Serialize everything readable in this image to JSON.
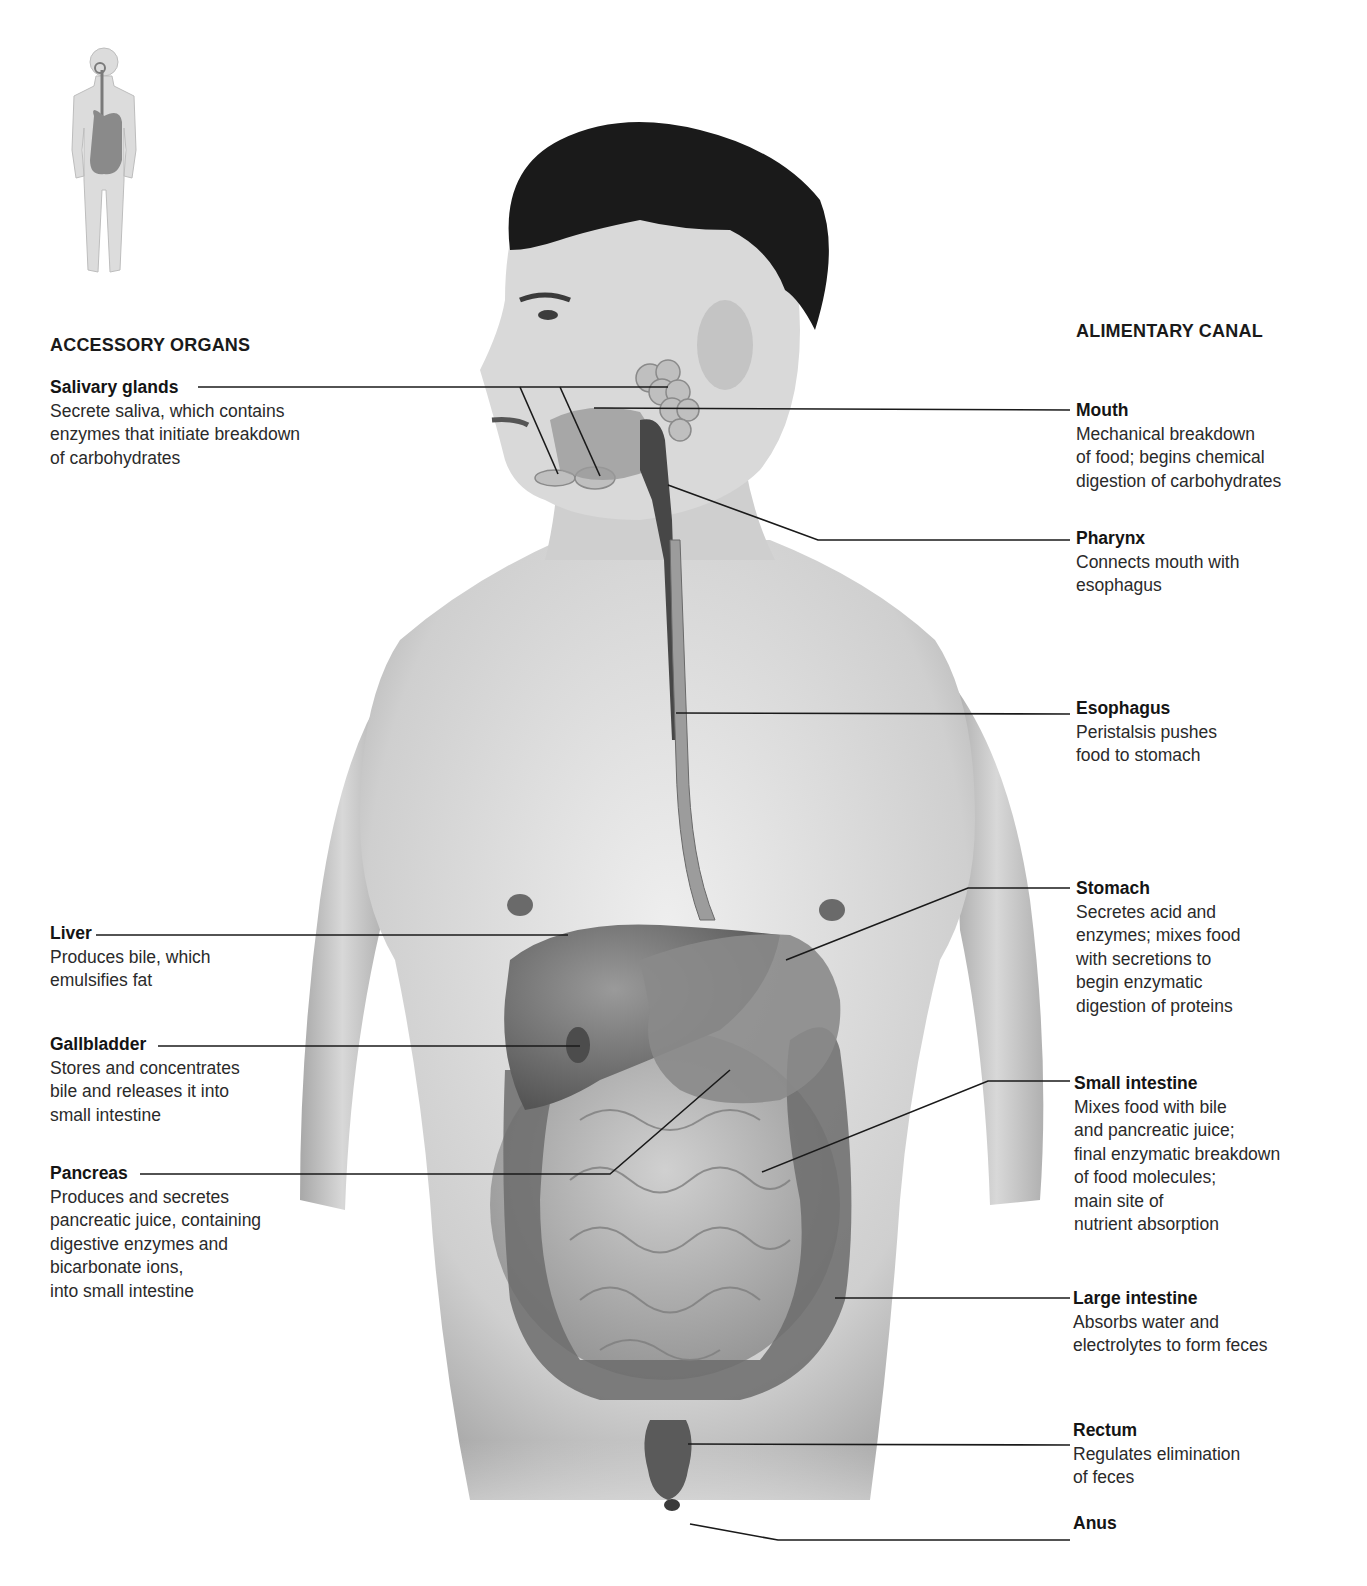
{
  "figure": {
    "sections": {
      "left_heading": "ACCESSORY ORGANS",
      "right_heading": "ALIMENTARY CANAL"
    },
    "locator_icon": "human-body-locator-digestive-system",
    "accessory_organs": [
      {
        "name": "Salivary glands",
        "description": "Secrete saliva, which contains\nenzymes that initiate breakdown\nof carbohydrates"
      },
      {
        "name": "Liver",
        "description": "Produces bile, which\nemulsifies fat"
      },
      {
        "name": "Gallbladder",
        "description": "Stores and concentrates\nbile and releases it into\nsmall intestine"
      },
      {
        "name": "Pancreas",
        "description": "Produces and secretes\npancreatic juice, containing\ndigestive enzymes and\nbicarbonate ions,\ninto small intestine"
      }
    ],
    "alimentary_canal": [
      {
        "name": "Mouth",
        "description": "Mechanical breakdown\nof food; begins chemical\ndigestion of carbohydrates"
      },
      {
        "name": "Pharynx",
        "description": "Connects mouth with\nesophagus"
      },
      {
        "name": "Esophagus",
        "description": "Peristalsis pushes\nfood to stomach"
      },
      {
        "name": "Stomach",
        "description": "Secretes acid and\nenzymes; mixes food\nwith secretions to\nbegin enzymatic\ndigestion of proteins"
      },
      {
        "name": "Small intestine",
        "description": "Mixes food with bile\nand pancreatic juice;\nfinal enzymatic breakdown\nof food molecules;\nmain site of\nnutrient absorption"
      },
      {
        "name": "Large intestine",
        "description": "Absorbs water and\nelectrolytes to form feces"
      },
      {
        "name": "Rectum",
        "description": "Regulates elimination\nof feces"
      },
      {
        "name": "Anus",
        "description": ""
      }
    ],
    "colors": {
      "background": "#ffffff",
      "text": "#1e1e1e",
      "leader_line": "#1a1a1a",
      "skin": "#d6d6d6",
      "organ": "#6e6e6e",
      "hair": "#161616"
    }
  }
}
